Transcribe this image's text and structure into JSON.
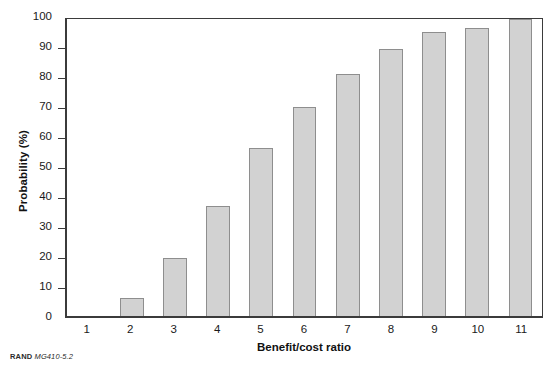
{
  "chart_data": {
    "type": "bar",
    "title": "",
    "xlabel": "Benefit/cost ratio",
    "ylabel": "Probability (%)",
    "categories": [
      "1",
      "2",
      "3",
      "4",
      "5",
      "6",
      "7",
      "8",
      "9",
      "10",
      "11"
    ],
    "values": [
      0,
      6,
      19.5,
      37,
      56.5,
      70.5,
      81.5,
      90,
      95.5,
      97,
      100
    ],
    "ylim": [
      0,
      100
    ],
    "ytick_labels": [
      "0",
      "10",
      "20",
      "30",
      "40",
      "50",
      "60",
      "70",
      "80",
      "90",
      "100"
    ],
    "ytick_values": [
      0,
      10,
      20,
      30,
      40,
      50,
      60,
      70,
      80,
      90,
      100
    ],
    "grid": false,
    "legend": null,
    "bar_fill": "#d2d2d2",
    "bar_edge": "#8e8e8e",
    "axis_color": "#3b3b3b"
  },
  "footer": {
    "brand": "RAND",
    "code": "MG410-5.2"
  }
}
